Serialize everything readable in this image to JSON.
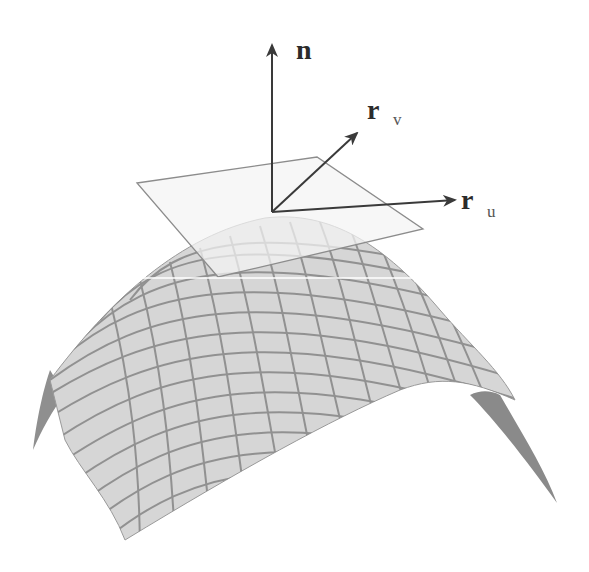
{
  "diagram": {
    "title": "",
    "labels": {
      "normal": "n",
      "rv_main": "r",
      "rv_sub": "v",
      "ru_main": "r",
      "ru_sub": "u"
    },
    "vectors": [
      {
        "name": "n",
        "from": [
          272,
          212
        ],
        "to": [
          272,
          45
        ]
      },
      {
        "name": "r_v",
        "from": [
          272,
          212
        ],
        "to": [
          357,
          133
        ]
      },
      {
        "name": "r_u",
        "from": [
          272,
          212
        ],
        "to": [
          455,
          200
        ]
      }
    ],
    "colors": {
      "arrow": "#3a3a3a",
      "surface_fill": "#d4d4d4",
      "grid_line": "#8a8a8a",
      "plane_fill": "#f2f2f2",
      "plane_edge": "#8c8c8c",
      "edge_dark": "#7a7a7a"
    }
  }
}
